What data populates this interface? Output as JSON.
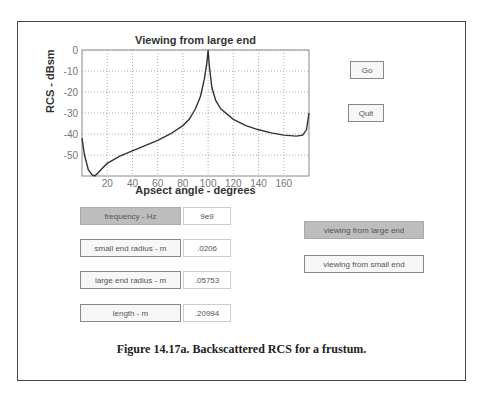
{
  "chart_data": {
    "type": "line",
    "title": "Viewing from large end",
    "xlabel": "Apsect angle - degrees",
    "ylabel": "RCS - dBsm",
    "xlim": [
      0,
      180
    ],
    "ylim": [
      -60,
      0
    ],
    "xticks": [
      20,
      40,
      60,
      80,
      100,
      120,
      140,
      160
    ],
    "yticks": [
      0,
      -10,
      -20,
      -30,
      -40,
      -50
    ],
    "grid": true,
    "series": [
      {
        "name": "RCS",
        "x": [
          0,
          2,
          5,
          8,
          10,
          12,
          15,
          20,
          30,
          40,
          50,
          60,
          70,
          80,
          85,
          90,
          94,
          97,
          99,
          100,
          101,
          103,
          106,
          110,
          120,
          130,
          140,
          150,
          160,
          170,
          175,
          178,
          180
        ],
        "y": [
          -42,
          -50,
          -57,
          -59.5,
          -60,
          -59,
          -57,
          -54,
          -50.5,
          -48,
          -45.5,
          -43,
          -40,
          -36,
          -33,
          -28,
          -22,
          -14,
          -6,
          0,
          -8,
          -18,
          -24,
          -28,
          -33,
          -36,
          -38,
          -39.5,
          -40.5,
          -41,
          -40.5,
          -38,
          -30
        ]
      }
    ]
  },
  "plot_title": "Viewing from large end",
  "axes": {
    "ylabel": "RCS - dBsm",
    "xlabel": "Apsect angle - degrees",
    "xtick_labels": [
      "20",
      "40",
      "60",
      "80",
      "100",
      "120",
      "140",
      "160"
    ],
    "ytick_labels": [
      "0",
      "-10",
      "-20",
      "-30",
      "-40",
      "-50"
    ]
  },
  "buttons": {
    "go": "Go",
    "quit": "Quit",
    "view_large": "viewing from large end",
    "view_small": "viewing from small end"
  },
  "params": [
    {
      "label": "frequency - Hz",
      "value": "9e9"
    },
    {
      "label": "small end radius - m",
      "value": ".0206"
    },
    {
      "label": "large end radius - m",
      "value": ".05753"
    },
    {
      "label": "length - m",
      "value": ".20994"
    }
  ],
  "caption": "Figure 14.17a. Backscattered RCS for a frustum."
}
